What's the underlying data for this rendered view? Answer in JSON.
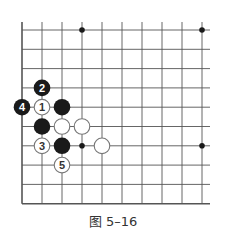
{
  "diagram": {
    "type": "go-board-fragment",
    "caption": "图 5–16",
    "grid": {
      "x0": 22,
      "dx": 20,
      "cols": 10,
      "y0": 30,
      "dy": 19.3,
      "rows": 10,
      "edges": {
        "left": true,
        "bottom": true,
        "top": false,
        "right": false
      },
      "line_color": "#555555"
    },
    "star_points": [
      {
        "col": 4,
        "row": 1
      },
      {
        "col": 10,
        "row": 1
      },
      {
        "col": 4,
        "row": 7
      },
      {
        "col": 10,
        "row": 7
      }
    ],
    "stones": [
      {
        "color": "black",
        "col": 2,
        "row": 4,
        "label": "2"
      },
      {
        "color": "black",
        "col": 1,
        "row": 5,
        "label": "4"
      },
      {
        "color": "white",
        "col": 2,
        "row": 5,
        "label": "1"
      },
      {
        "color": "black",
        "col": 3,
        "row": 5,
        "label": ""
      },
      {
        "color": "black",
        "col": 2,
        "row": 6,
        "label": ""
      },
      {
        "color": "white",
        "col": 3,
        "row": 6,
        "label": ""
      },
      {
        "color": "white",
        "col": 4,
        "row": 6,
        "label": ""
      },
      {
        "color": "white",
        "col": 2,
        "row": 7,
        "label": "3"
      },
      {
        "color": "black",
        "col": 3,
        "row": 7,
        "label": ""
      },
      {
        "color": "white",
        "col": 5,
        "row": 7,
        "label": ""
      },
      {
        "color": "white",
        "col": 3,
        "row": 8,
        "label": "5"
      }
    ],
    "colors": {
      "black_stone": "#1a1a1a",
      "white_stone": "#ffffff",
      "white_stone_border": "#777777"
    }
  }
}
